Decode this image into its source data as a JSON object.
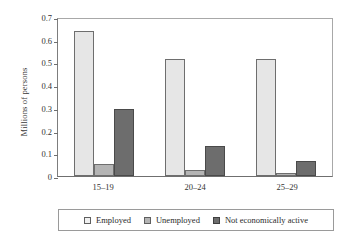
{
  "chart_data": {
    "type": "bar",
    "title": "",
    "xlabel": "",
    "ylabel": "Millions of persons",
    "categories": [
      "15–19",
      "20–24",
      "25–29"
    ],
    "series": [
      {
        "name": "Employed",
        "values": [
          0.64,
          0.515,
          0.513
        ],
        "color": "#e6e6e6"
      },
      {
        "name": "Unemployed",
        "values": [
          0.053,
          0.028,
          0.012
        ],
        "color": "#b4b4b4"
      },
      {
        "name": "Not economically active",
        "values": [
          0.295,
          0.132,
          0.065
        ],
        "color": "#6d6d6d"
      }
    ],
    "ylim": [
      0,
      0.7
    ],
    "yticks": [
      "0",
      "0.1",
      "0.2",
      "0.3",
      "0.4",
      "0.5",
      "0.6",
      "0.7"
    ],
    "ytick_values": [
      0,
      0.1,
      0.2,
      0.3,
      0.4,
      0.5,
      0.6,
      0.7
    ],
    "grid": false,
    "legend_position": "bottom"
  }
}
